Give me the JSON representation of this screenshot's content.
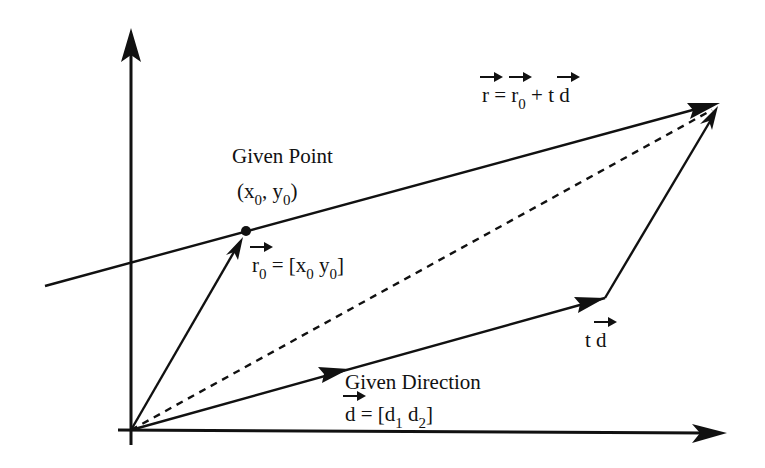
{
  "diagram": {
    "type": "vector-line-parametric",
    "colors": {
      "stroke": "#111111",
      "background": "#ffffff"
    },
    "labels": {
      "equation": {
        "r": "r",
        "equals": " = ",
        "r0": "r",
        "r0_sub": "0",
        "plus": " + t ",
        "d": "d"
      },
      "given_point": {
        "title": "Given Point",
        "coord_open": "(x",
        "coord_x_sub": "0",
        "coord_sep": ", y",
        "coord_y_sub": "0",
        "coord_close": ")"
      },
      "r0_def": {
        "r": "r",
        "r_sub": "0",
        "eq": " = [x",
        "x_sub": "0",
        "mid": "  y",
        "y_sub": "0",
        "close": "]"
      },
      "given_direction": {
        "title": "Given Direction",
        "d": "d",
        "eq": " = [d",
        "d1_sub": "1",
        "mid": "  d",
        "d2_sub": "2",
        "close": "]"
      },
      "t_d": {
        "t": "t ",
        "d": "d"
      }
    },
    "geometry": {
      "origin": [
        131,
        430
      ],
      "y_axis_top": [
        131,
        28
      ],
      "x_axis_end": [
        727,
        433
      ],
      "given_point": [
        246,
        231
      ],
      "line_start": [
        45,
        286
      ],
      "line_end": [
        720,
        103
      ],
      "td_end": [
        605,
        298
      ],
      "direction_arrow_tip": [
        347,
        369
      ]
    }
  }
}
